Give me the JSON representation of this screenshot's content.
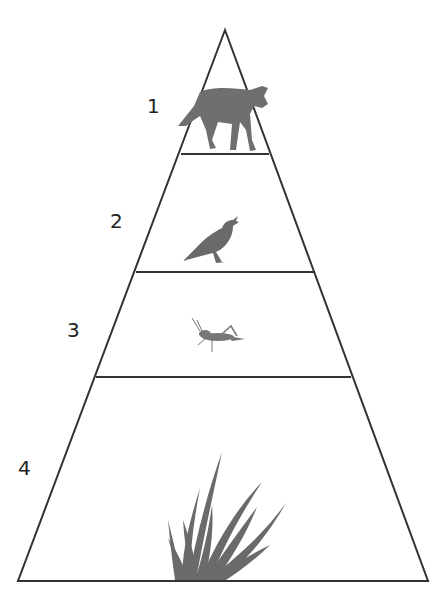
{
  "diagram": {
    "type": "ecological food pyramid",
    "line_color": "#333333",
    "levels": [
      {
        "number": "1",
        "organism": "coyote",
        "icon": "coyote-icon"
      },
      {
        "number": "2",
        "organism": "meadowlark bird",
        "icon": "bird-icon"
      },
      {
        "number": "3",
        "organism": "grasshopper",
        "icon": "grasshopper-icon"
      },
      {
        "number": "4",
        "organism": "grass",
        "icon": "grass-icon"
      }
    ]
  }
}
